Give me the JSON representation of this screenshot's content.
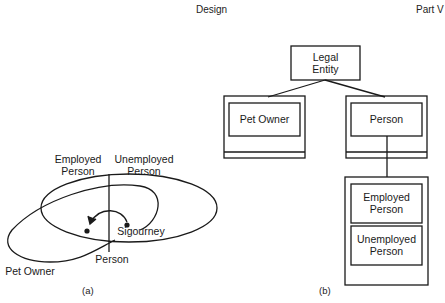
{
  "header": {
    "center": "Design",
    "right": "Part V"
  },
  "figure_a": {
    "caption": "(a)",
    "labels": {
      "employed_person": [
        "Employed",
        "Person"
      ],
      "unemployed_person": [
        "Unemployed",
        "Person"
      ],
      "sigourney": "Sigourney",
      "person": "Person",
      "pet_owner": "Pet Owner"
    }
  },
  "figure_b": {
    "caption": "(b)",
    "nodes": {
      "legal_entity": [
        "Legal",
        "Entity"
      ],
      "pet_owner": "Pet Owner",
      "person": "Person",
      "employed_person": [
        "Employed",
        "Person"
      ],
      "unemployed_person": [
        "Unemployed",
        "Person"
      ]
    }
  },
  "colors": {
    "line": "#1a1a1a",
    "background": "#ffffff"
  }
}
